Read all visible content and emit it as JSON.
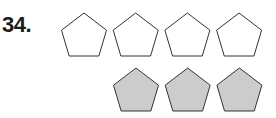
{
  "problem": {
    "number": "34.",
    "rows": [
      {
        "shape": "pentagon",
        "count": 4,
        "fill": "#ffffff",
        "stroke": "#333333"
      },
      {
        "shape": "pentagon",
        "count": 3,
        "fill": "#cccccc",
        "stroke": "#333333"
      }
    ]
  }
}
